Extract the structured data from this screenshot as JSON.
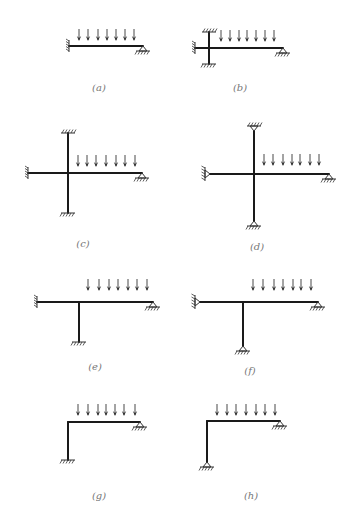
{
  "figure": {
    "colors": {
      "ink": "#1a1a1a",
      "label": "#777777",
      "background": "#ffffff"
    },
    "panels": [
      {
        "id": "a",
        "label": "(a)",
        "supports": [
          "fixed-left",
          "pin-right"
        ],
        "load_arrows": 7
      },
      {
        "id": "b",
        "label": "(b)",
        "supports": [
          "fixed-left",
          "fixed-top",
          "fixed-bottom",
          "pin-right"
        ],
        "load_arrows": 7
      },
      {
        "id": "c",
        "label": "(c)",
        "supports": [
          "fixed-left",
          "fixed-top",
          "fixed-bottom",
          "pin-right"
        ],
        "load_arrows": 7
      },
      {
        "id": "d",
        "label": "(d)",
        "supports": [
          "pin-left",
          "pin-top",
          "pin-bottom",
          "pin-right"
        ],
        "load_arrows": 7
      },
      {
        "id": "e",
        "label": "(e)",
        "supports": [
          "fixed-left",
          "fixed-bottom",
          "pin-right"
        ],
        "load_arrows": 7
      },
      {
        "id": "f",
        "label": "(f)",
        "supports": [
          "pin-left",
          "pin-bottom",
          "pin-right"
        ],
        "load_arrows": 7
      },
      {
        "id": "g",
        "label": "(g)",
        "supports": [
          "fixed-bottom",
          "pin-right"
        ],
        "load_arrows": 7
      },
      {
        "id": "h",
        "label": "(h)",
        "supports": [
          "pin-bottom",
          "pin-right"
        ],
        "load_arrows": 7
      }
    ]
  }
}
